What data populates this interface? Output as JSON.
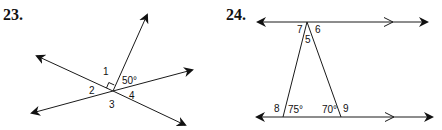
{
  "problems": [
    {
      "number": "23.",
      "labels": {
        "angle1": "1",
        "angle2": "2",
        "angle3": "3",
        "angle4": "4",
        "given": "50°"
      },
      "marks": [
        "right-angle between angle 1 and ray"
      ]
    },
    {
      "number": "24.",
      "labels": {
        "angle5": "5",
        "angle6": "6",
        "angle7": "7",
        "angle8": "8",
        "angle9": "9",
        "given_left": "75°",
        "given_right": "70°"
      },
      "marks": [
        "parallel chevrons on top and bottom lines"
      ]
    }
  ],
  "colors": {
    "ink": "#1a1a1a",
    "background": "#ffffff"
  }
}
